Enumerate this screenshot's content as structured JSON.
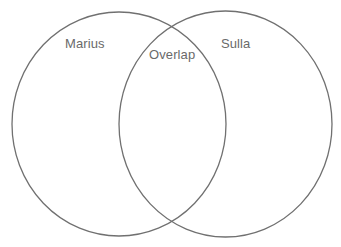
{
  "diagram": {
    "type": "venn",
    "sets": [
      {
        "id": "left",
        "label": "Marius"
      },
      {
        "id": "right",
        "label": "Sulla"
      }
    ],
    "overlap": {
      "label": "Overlap"
    },
    "colors": {
      "stroke": "#707070",
      "text": "#6a6a6a",
      "background": "#ffffff"
    }
  }
}
